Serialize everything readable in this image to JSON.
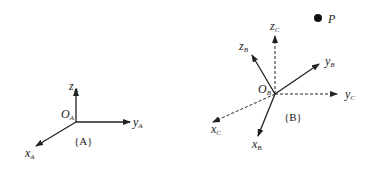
{
  "diagram": {
    "type": "coordinate-frames",
    "frame_a": {
      "name": "{A}",
      "origin_label": "O",
      "origin_sub": "A",
      "axes": [
        {
          "name": "x",
          "sub": "A",
          "style": "solid"
        },
        {
          "name": "y",
          "sub": "A",
          "style": "solid"
        },
        {
          "name": "z",
          "sub": "A",
          "style": "solid"
        }
      ]
    },
    "frame_b": {
      "name": "{B}",
      "origin_label": "O",
      "origin_sub": "B",
      "axes": [
        {
          "name": "x",
          "sub": "B",
          "style": "solid"
        },
        {
          "name": "y",
          "sub": "B",
          "style": "solid"
        },
        {
          "name": "z",
          "sub": "B",
          "style": "solid"
        },
        {
          "name": "x",
          "sub": "C",
          "style": "dashed"
        },
        {
          "name": "y",
          "sub": "C",
          "style": "dashed"
        },
        {
          "name": "z",
          "sub": "C",
          "style": "dashed"
        }
      ]
    },
    "point": {
      "label": "P"
    },
    "colors": {
      "stroke": "#222222",
      "background": "#ffffff"
    }
  }
}
